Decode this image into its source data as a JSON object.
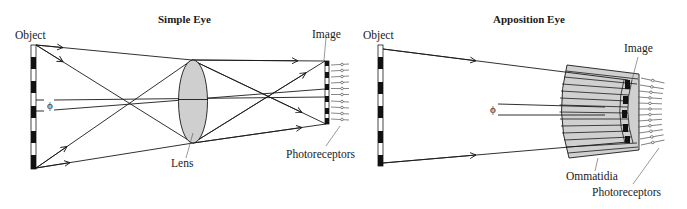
{
  "figure": {
    "panels": [
      {
        "title": "Simple Eye",
        "labels": {
          "object": "Object",
          "image": "Image",
          "lens": "Lens",
          "photoreceptors": "Photoreceptors",
          "angle": "ϕ"
        }
      },
      {
        "title": "Apposition Eye",
        "labels": {
          "object": "Object",
          "image": "Image",
          "ommatidia": "Ommatidia",
          "photoreceptors": "Photoreceptors",
          "angle": "ϕ"
        }
      }
    ],
    "colors": {
      "line": "#1a1a1a",
      "lens_fill": "#cfcfcf",
      "ommatidia_fill": "#d0d0d0",
      "bar_dark": "#111111",
      "bar_light": "#ffffff"
    }
  }
}
